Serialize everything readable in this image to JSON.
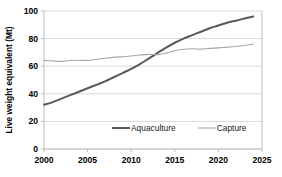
{
  "chart_data": {
    "type": "line",
    "title": "",
    "xlabel": "",
    "ylabel": "Live weight equivalent (Mt)",
    "xlim": [
      2000,
      2025
    ],
    "ylim": [
      0,
      100
    ],
    "xticks": [
      2000,
      2005,
      2010,
      2015,
      2020,
      2025
    ],
    "yticks": [
      0,
      20,
      40,
      60,
      80,
      100
    ],
    "xtick_labels": [
      "2000",
      "2005",
      "2010",
      "2015",
      "2020",
      "2025"
    ],
    "ytick_labels": [
      "0",
      "20",
      "40",
      "60",
      "80",
      "100"
    ],
    "grid": "horizontal",
    "legend_position": "inside-bottom-center",
    "x": [
      2000,
      2001,
      2002,
      2003,
      2004,
      2005,
      2006,
      2007,
      2008,
      2009,
      2010,
      2011,
      2012,
      2013,
      2014,
      2015,
      2016,
      2017,
      2018,
      2019,
      2020,
      2021,
      2022,
      2023,
      2024
    ],
    "series": [
      {
        "name": "Aquaculture",
        "color": "#595959",
        "line_width": 2.0,
        "values": [
          32,
          34,
          36.5,
          39,
          41.5,
          44,
          46.5,
          49,
          52,
          55,
          58,
          61.5,
          65.5,
          69.5,
          73.5,
          77,
          80,
          82.5,
          85,
          87.5,
          89.5,
          91.5,
          93,
          94.5,
          96
        ]
      },
      {
        "name": "Capture",
        "color": "#a6a6a6",
        "line_width": 1.1,
        "values": [
          64.2,
          63.8,
          63.5,
          64.1,
          64.3,
          64.2,
          65.0,
          65.8,
          66.4,
          66.9,
          67.4,
          68.1,
          68.6,
          68.4,
          69.5,
          71.2,
          72.3,
          72.6,
          72.4,
          72.9,
          73.3,
          73.8,
          74.3,
          75.0,
          75.9
        ]
      }
    ]
  },
  "legend": {
    "items": [
      {
        "label": "Aquaculture",
        "color": "#595959"
      },
      {
        "label": "Capture",
        "color": "#a6a6a6"
      }
    ]
  }
}
